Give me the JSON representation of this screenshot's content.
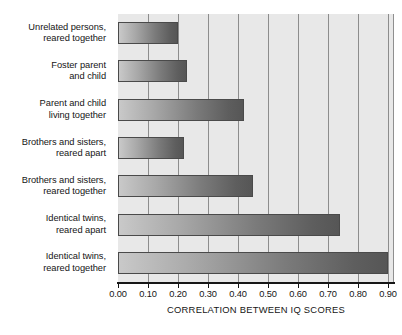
{
  "chart_data": {
    "type": "bar",
    "orientation": "horizontal",
    "title": "",
    "xlabel": "CORRELATION BETWEEN IQ SCORES",
    "ylabel": "",
    "xlim": [
      0.0,
      0.92
    ],
    "xticks": [
      0.0,
      0.1,
      0.2,
      0.3,
      0.4,
      0.5,
      0.6,
      0.7,
      0.8,
      0.9
    ],
    "xtick_labels": [
      "0.00",
      "0.10",
      "0.20",
      "0.30",
      "0.40",
      "0.50",
      "0.60",
      "0.70",
      "0.80",
      "0.90"
    ],
    "grid": true,
    "grid_axis": "x",
    "legend": false,
    "categories": [
      "Unrelated persons, reared together",
      "Foster parent and child",
      "Parent and child living together",
      "Brothers and sisters, reared apart",
      "Brothers and sisters, reared together",
      "Identical twins, reared apart",
      "Identical twins, reared together"
    ],
    "values": [
      0.2,
      0.23,
      0.42,
      0.22,
      0.45,
      0.74,
      0.9
    ],
    "bar_gradient_from": "#c9c9c9",
    "bar_gradient_to": "#565656",
    "plot_background": "#e8e8e8"
  },
  "categories": [
    {
      "line1": "Unrelated persons,",
      "line2": "reared together"
    },
    {
      "line1": "Foster parent",
      "line2": "and child"
    },
    {
      "line1": "Parent and child",
      "line2": "living together"
    },
    {
      "line1": "Brothers and sisters,",
      "line2": "reared apart"
    },
    {
      "line1": "Brothers and sisters,",
      "line2": "reared together"
    },
    {
      "line1": "Identical twins,",
      "line2": "reared apart"
    },
    {
      "line1": "Identical twins,",
      "line2": "reared together"
    }
  ],
  "axis": {
    "title": "CORRELATION BETWEEN IQ SCORES",
    "tick_labels": [
      "0.00",
      "0.10",
      "0.20",
      "0.30",
      "0.40",
      "0.50",
      "0.60",
      "0.70",
      "0.80",
      "0.90"
    ]
  }
}
